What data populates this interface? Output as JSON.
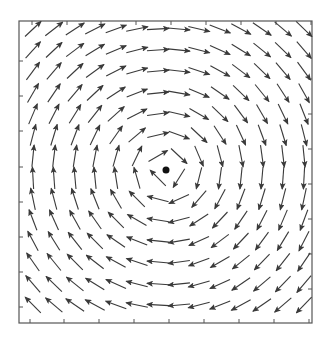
{
  "figure": {
    "colors": {
      "arrow": "#3a3a3a",
      "frame": "#555555",
      "center_dot": "#111111",
      "background": "#ffffff"
    }
  },
  "chart_data": {
    "type": "quiver",
    "title": "",
    "xlabel": "",
    "ylabel": "",
    "frame_px": {
      "left": 19,
      "top": 21,
      "right": 312,
      "bottom": 323
    },
    "ticks_px": {
      "top": [
        32,
        67,
        101,
        136,
        171,
        206,
        241,
        276,
        311
      ],
      "bottom": [
        30,
        64,
        99,
        134,
        169,
        204,
        239,
        274,
        309
      ],
      "left": [
        61,
        96,
        131,
        167,
        202,
        237,
        272,
        307
      ],
      "right": [
        79,
        114,
        149,
        184,
        219,
        254,
        289
      ]
    },
    "center_point_px": {
      "x": 166,
      "y": 170,
      "r": 3.5
    },
    "rotation": "clockwise",
    "arrow_length_px": 22,
    "grid_x_px": [
      33,
      54,
      75,
      95,
      116,
      137,
      158,
      179,
      199,
      220,
      241,
      262,
      283,
      304
    ],
    "grid_y_px": [
      29,
      50,
      71,
      93,
      114,
      135,
      156,
      178,
      199,
      220,
      241,
      262,
      284,
      305
    ],
    "angles_deg": [
      [
        -43,
        -38,
        -33,
        -27,
        -20,
        -12,
        -3,
        5,
        13,
        21,
        28,
        34,
        40,
        44
      ],
      [
        -48,
        -43,
        -37,
        -31,
        -23,
        -14,
        -4,
        6,
        15,
        24,
        32,
        39,
        44,
        49
      ],
      [
        -53,
        -49,
        -43,
        -36,
        -27,
        -16,
        -5,
        7,
        18,
        29,
        37,
        44,
        50,
        54
      ],
      [
        -60,
        -56,
        -50,
        -43,
        -33,
        -21,
        -6,
        10,
        23,
        35,
        44,
        51,
        57,
        61
      ],
      [
        -67,
        -63,
        -58,
        -52,
        -42,
        -27,
        -8,
        13,
        30,
        44,
        53,
        60,
        64,
        68
      ],
      [
        -75,
        -73,
        -69,
        -64,
        -55,
        -40,
        -13,
        20,
        43,
        57,
        65,
        70,
        73,
        76
      ],
      [
        -84,
        -83,
        -81,
        -79,
        -74,
        -64,
        -30,
        43,
        67,
        75,
        79,
        82,
        83,
        84
      ],
      [
        -93,
        -94,
        -95,
        -96,
        -99,
        -106,
        -135,
        122,
        104,
        98,
        96,
        95,
        94,
        93
      ],
      [
        -102,
        -105,
        -108,
        -112,
        -120,
        -135,
        -165,
        156,
        131,
        118,
        111,
        107,
        104,
        102
      ],
      [
        -111,
        -114,
        -119,
        -125,
        -135,
        -150,
        -171,
        165,
        147,
        133,
        124,
        117,
        113,
        110
      ],
      [
        -118,
        -122,
        -128,
        -135,
        -145,
        -158,
        -174,
        170,
        155,
        143,
        133,
        126,
        121,
        117
      ],
      [
        -125,
        -129,
        -135,
        -142,
        -151,
        -162,
        -175,
        172,
        160,
        150,
        141,
        134,
        128,
        124
      ],
      [
        -131,
        -136,
        -141,
        -148,
        -156,
        -166,
        -176,
        174,
        164,
        155,
        146,
        140,
        134,
        130
      ],
      [
        -135,
        -140,
        -146,
        -152,
        -160,
        -168,
        -177,
        175,
        166,
        158,
        151,
        145,
        139,
        134
      ]
    ],
    "angle_convention": "screen degrees, 0 = right, 90 = down; arrow tail at grid point"
  }
}
